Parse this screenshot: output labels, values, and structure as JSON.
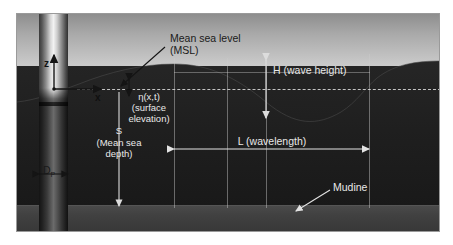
{
  "figure": {
    "background_color": "#ffffff",
    "frame_border_color": "#9a9a9a"
  },
  "colors": {
    "sky_top": "#8e8e8e",
    "sky_bottom": "#e6e6e6",
    "water": "#1e1e1e",
    "seabed": "#414141",
    "pile_highlight": "#f2f2f2",
    "label_dark": "#1a1a1a",
    "label_light": "#e9e9e9",
    "msl_dash": "#e1e1e1"
  },
  "axes": {
    "z_label": "z",
    "x_label": "x",
    "origin_note": "origin at still water level on pile axis"
  },
  "labels": {
    "msl": "Mean sea level\n(MSL)",
    "msl_line1": "Mean sea level",
    "msl_line2": "(MSL)",
    "eta": "η(x,t)\n(surface\nelevation)",
    "eta_line1": "η(x,t)",
    "eta_line2": "(surface",
    "eta_line3": "elevation)",
    "wave_height": "H (wave height)",
    "wavelength": "L (wavelength)",
    "mean_sea_depth": "S\n(Mean sea\ndepth)",
    "depth_line1": "S",
    "depth_line2": "(Mean sea",
    "depth_line3": "depth)",
    "pile_diameter": "D",
    "pile_diameter_sub": "P",
    "mudline": "Mudine"
  },
  "symbols": {
    "H": "H",
    "L": "L",
    "S": "S",
    "Dp": "D_P",
    "eta": "η(x,t)"
  },
  "geometry": {
    "wave_crest_1_x": 157,
    "wave_trough_x": 249,
    "wave_crest_2_x": 352,
    "msl_y": 75,
    "mudline_y": 194,
    "pile_left_x": 22,
    "pile_width": 29
  }
}
